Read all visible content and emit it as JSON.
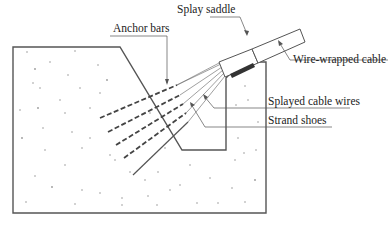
{
  "diagram": {
    "labels": {
      "splay_saddle": "Splay saddle",
      "anchor_bars": "Anchor bars",
      "wire_wrapped_cable": "Wire-wrapped cable",
      "splayed_cable_wires": "Splayed cable wires",
      "strand_shoes": "Strand shoes"
    },
    "colors": {
      "line": "#555555",
      "dark_bar": "#333333",
      "speckle": "#999999",
      "text": "#222222"
    }
  }
}
